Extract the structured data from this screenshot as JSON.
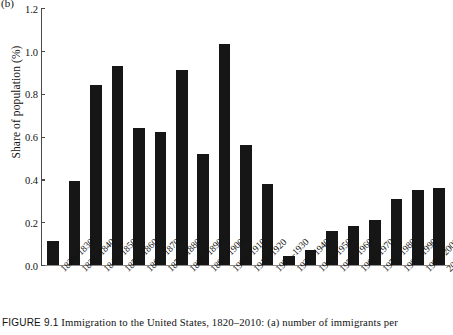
{
  "panel": {
    "label": "(b)"
  },
  "caption": {
    "figure_number": "FIGURE 9.1",
    "text": "Immigration to the United States, 1820–2010: (a) number of immigrants per"
  },
  "chart_data": {
    "type": "bar",
    "title": "",
    "subtitle": "",
    "xlabel": "",
    "ylabel": "Share of population (%)",
    "ylim": [
      0.0,
      1.2
    ],
    "yticks": [
      "0.0",
      "0.2",
      "0.4",
      "0.6",
      "0.8",
      "1.0",
      "1.2"
    ],
    "ytick_values": [
      0.0,
      0.2,
      0.4,
      0.6,
      0.8,
      1.0,
      1.2
    ],
    "grid": false,
    "legend": false,
    "bar_color": "#161616",
    "categories": [
      "1820–1830",
      "1831–1840",
      "1841–1850",
      "1851–1860",
      "1861–1870",
      "1871–1880",
      "1881–1890",
      "1891–1900",
      "1901–1910",
      "1911–1920",
      "1921–1930",
      "1931–1940",
      "1941–1950",
      "1951–1960",
      "1961–1970",
      "1971–1980",
      "1981–1990",
      "1991–2000",
      "2001–2010"
    ],
    "values": [
      0.11,
      0.39,
      0.84,
      0.93,
      0.64,
      0.62,
      0.91,
      0.52,
      1.03,
      0.56,
      0.38,
      0.04,
      0.07,
      0.16,
      0.18,
      0.21,
      0.31,
      0.35,
      0.36
    ]
  }
}
